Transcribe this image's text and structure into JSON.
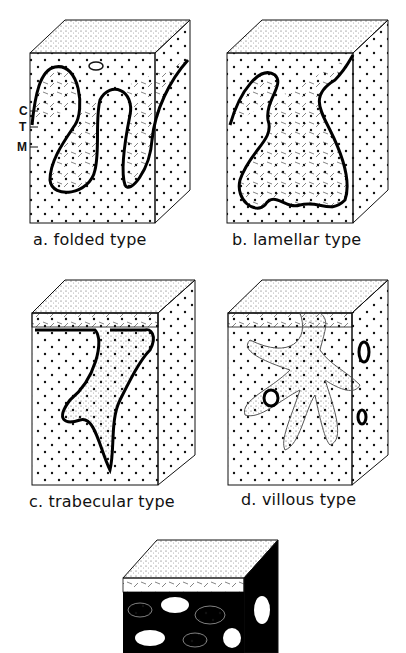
{
  "figure": {
    "panels": [
      {
        "id": "a",
        "caption": "a. folded type"
      },
      {
        "id": "b",
        "caption": "b. lamellar type"
      },
      {
        "id": "c",
        "caption": "c. trabecular type"
      },
      {
        "id": "d",
        "caption": "d. villous type"
      },
      {
        "id": "e",
        "caption": ""
      }
    ],
    "layer_labels": [
      "C",
      "T",
      "M"
    ]
  }
}
